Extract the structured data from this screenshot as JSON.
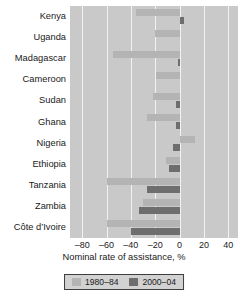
{
  "chart_data": {
    "type": "bar",
    "orientation": "horizontal",
    "title": "",
    "xlabel": "Nominal rate of assistance, %",
    "ylabel": "",
    "xlim": [
      -90,
      48
    ],
    "xticks": [
      -80,
      -60,
      -40,
      -20,
      0,
      20,
      40
    ],
    "xtick_labels": [
      "–80",
      "–60",
      "–40",
      "–20",
      "0",
      "20",
      "40"
    ],
    "grid": true,
    "grid_axis": "x",
    "legend_position": "bottom",
    "categories": [
      "Kenya",
      "Uganda",
      "Madagascar",
      "Cameroon",
      "Sudan",
      "Ghana",
      "Nigeria",
      "Ethiopia",
      "Tanzania",
      "Zambia",
      "Côte d’Ivoire"
    ],
    "series": [
      {
        "name": "1980–84",
        "color": "#b4b4b4",
        "values": [
          -36,
          -20,
          -55,
          -19,
          -22,
          -27,
          13,
          -11,
          -60,
          -30,
          -60
        ]
      },
      {
        "name": "2000–04",
        "color": "#6e6e6e",
        "values": [
          4,
          0,
          -1,
          0,
          -3,
          -3,
          -5,
          -9,
          -27,
          -33,
          -40
        ]
      }
    ]
  },
  "legend": {
    "items": [
      {
        "label": "1980–84",
        "color": "#b4b4b4"
      },
      {
        "label": "2000–04",
        "color": "#6e6e6e"
      }
    ]
  },
  "axis": {
    "x_title": "Nominal rate of assistance, %"
  },
  "colors": {
    "plot_background": "#c9c9c9",
    "gridline": "#f2f2f2",
    "series_early": "#b4b4b4",
    "series_late": "#6e6e6e",
    "text": "#1a1a1a",
    "legend_background": "#d2d2d2",
    "legend_border": "#3d3d3d"
  }
}
